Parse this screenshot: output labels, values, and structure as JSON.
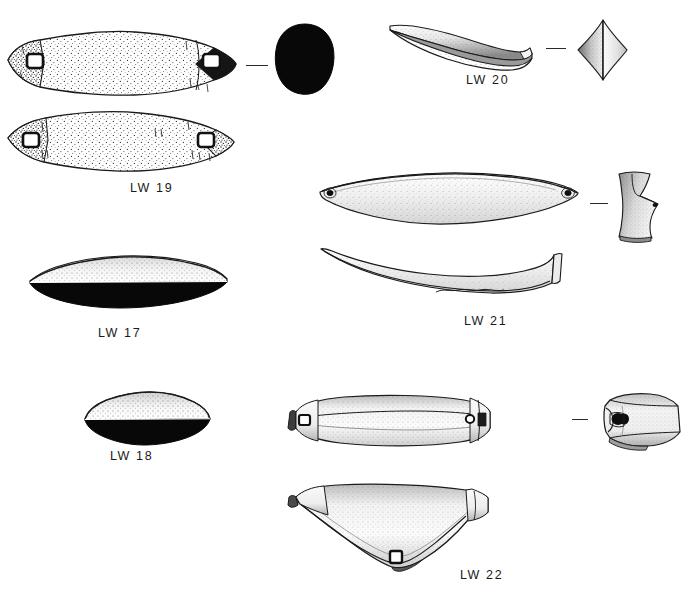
{
  "plate": {
    "type": "archaeological-artifact-illustration-plate",
    "background_color": "#ffffff",
    "ink_color": "#1a1a1a",
    "width": 690,
    "height": 596,
    "caption_font_size_px": 12.5
  },
  "figures": [
    {
      "id": "lw19",
      "label": "LW 19",
      "label_x": 130,
      "label_y": 181,
      "description": "Elongate lenticular net sinker, two views (dorsal and ventral) with notched perforated ends",
      "views": [
        "plan-view-upper",
        "plan-view-lower",
        "cross-section"
      ],
      "cross_section_shape": "solid-filled-oval",
      "perforations": 2
    },
    {
      "id": "lw20",
      "label": "LW 20",
      "label_x": 466,
      "label_y": 73,
      "description": "Curved crescentic weight shown in profile with rhomboid cross-section",
      "views": [
        "profile-view",
        "cross-section"
      ],
      "cross_section_shape": "diamond-rhombus",
      "perforations": 0
    },
    {
      "id": "lw17",
      "label": "LW 17",
      "label_x": 98,
      "label_y": 326,
      "description": "Low lenticular weight, profile with solid black lower half",
      "views": [
        "profile-view"
      ],
      "cross_section_shape": "solid-black-lens",
      "perforations": 0
    },
    {
      "id": "lw21",
      "label": "LW 21",
      "label_x": 464,
      "label_y": 314,
      "description": "Long leaf-shaped blade with small drilled holes at each tip, plan and profile views",
      "views": [
        "plan-view",
        "profile-view",
        "cross-section"
      ],
      "cross_section_shape": "concave-flared",
      "perforations": 2
    },
    {
      "id": "lw18",
      "label": "LW 18",
      "label_x": 110,
      "label_y": 449,
      "description": "Small ovate weight, profile with solid black lower half",
      "views": [
        "profile-view"
      ],
      "cross_section_shape": "solid-black-lens",
      "perforations": 0
    },
    {
      "id": "lw22",
      "label": "LW 22",
      "label_x": 460,
      "label_y": 568,
      "description": "Elongate faceted bar weight with notched perforated ends, plan, profile and end views",
      "views": [
        "plan-view",
        "profile-view",
        "end-view"
      ],
      "cross_section_shape": "faceted-hexagonal",
      "perforations": 3
    }
  ]
}
